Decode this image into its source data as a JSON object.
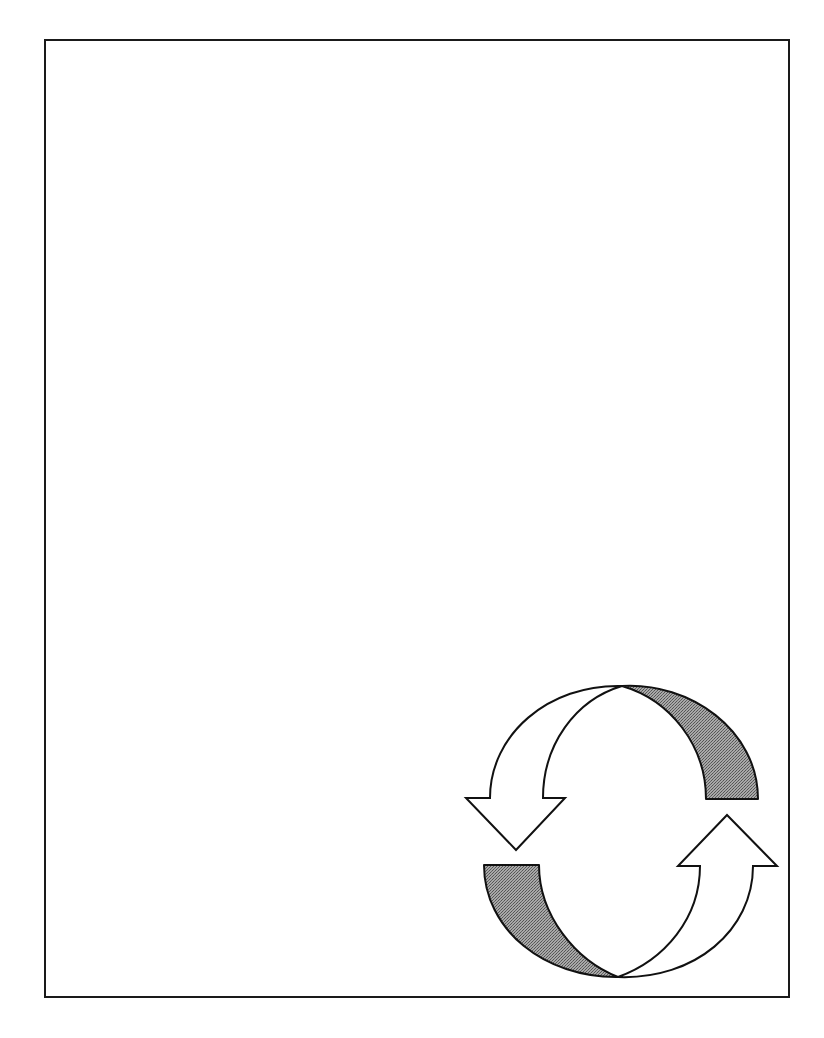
{
  "page": {
    "frame": {
      "stroke_color": "#1a1a1a",
      "background": "#ffffff"
    }
  },
  "graphic": {
    "type": "cycle-arrows",
    "arrows": [
      {
        "name": "down-arrow",
        "direction": "down",
        "position": "left",
        "fill": "#ffffff"
      },
      {
        "name": "up-arrow",
        "direction": "up",
        "position": "right",
        "fill": "#ffffff"
      }
    ],
    "shaded_bands": [
      {
        "name": "top-right-band",
        "fill": "#8c8c8c"
      },
      {
        "name": "bottom-left-band",
        "fill": "#8c8c8c"
      }
    ],
    "stroke_color": "#111111"
  }
}
